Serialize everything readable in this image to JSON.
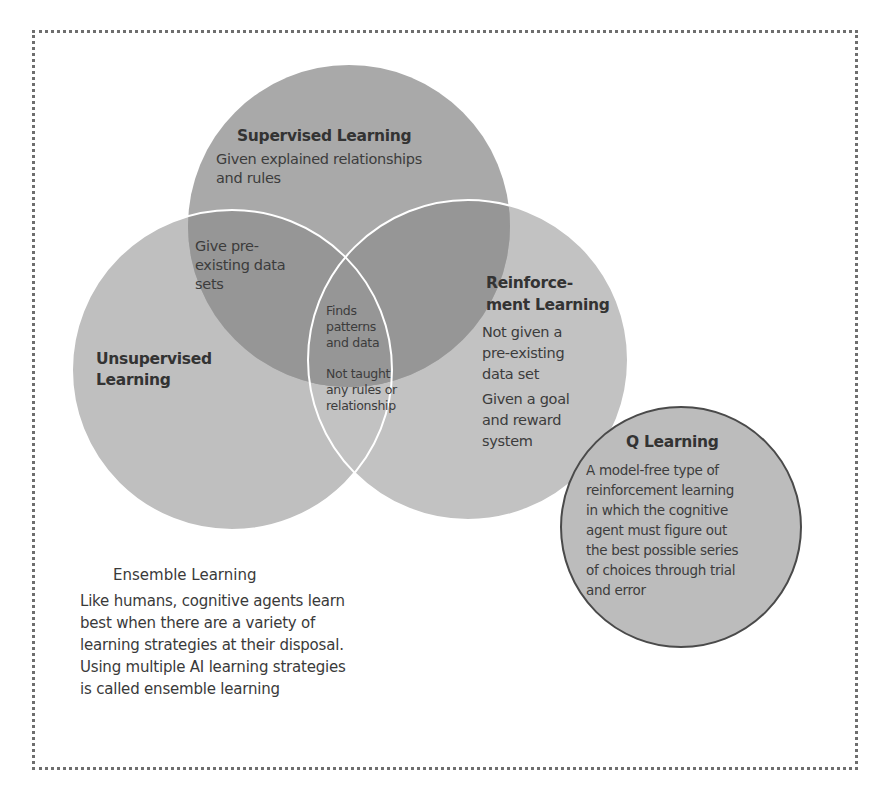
{
  "diagram": {
    "type": "venn",
    "colors": {
      "frame_border": "#6e6e6e",
      "supervised_fill": "#a9a9a9",
      "unsupervised_fill": "#bfbfbf",
      "reinforcement_fill": "#c2c2c2",
      "overlap_fill": "#969696",
      "q_learning_fill": "#bcbcbc",
      "q_learning_outline": "#4a4a4a",
      "circle_outline": "#ffffff"
    },
    "supervised": {
      "title": "Supervised Learning",
      "description": "Given explained relationships and rules"
    },
    "unsupervised": {
      "title_line1": "Unsupervised",
      "title_line2": "Learning"
    },
    "reinforcement": {
      "title_line1": "Reinforce-",
      "title_line2": "ment Learning",
      "desc1_line1": "Not given a",
      "desc1_line2": "pre-existing",
      "desc1_line3": "data set",
      "desc2_line1": "Given a goal",
      "desc2_line2": "and reward",
      "desc2_line3": "system"
    },
    "overlap_supervised_unsupervised": {
      "line1": "Give pre-",
      "line2": "existing data",
      "line3": "sets"
    },
    "center_overlap": {
      "line1": "Finds",
      "line2": "patterns",
      "line3": "and data",
      "line4": "Not taught",
      "line5": "any rules or",
      "line6": "relationship"
    },
    "q_learning": {
      "title": "Q Learning",
      "line1": "A model-free type of",
      "line2": "reinforcement learning",
      "line3": "in which the cognitive",
      "line4": "agent must figure out",
      "line5": "the best possible series",
      "line6": "of choices through trial",
      "line7": "and error"
    },
    "ensemble": {
      "title": "Ensemble Learning",
      "body": "Like humans, cognitive agents learn best when there are a variety of learning strategies at their disposal. Using multiple AI learning strategies is called ensemble learning"
    }
  }
}
